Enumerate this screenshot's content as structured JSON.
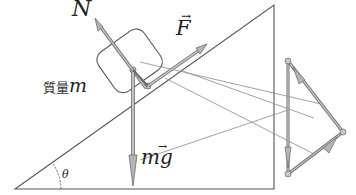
{
  "diagram": {
    "labels": {
      "normal_force": "N",
      "applied_force": "F",
      "mass_prefix": "質量",
      "mass_symbol": "m",
      "gravity": "mg",
      "angle": "θ"
    },
    "colors": {
      "line": "#555555",
      "arrow_fill": "#b5b5b5",
      "arrow_stroke": "#6a6a6a",
      "guide": "#8a8a8a",
      "text": "#222222"
    }
  }
}
